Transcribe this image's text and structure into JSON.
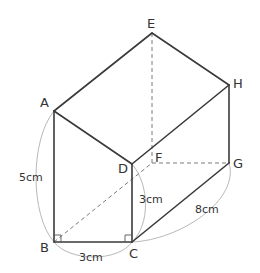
{
  "figure": {
    "type": "triangular-prism",
    "vertices": {
      "A": {
        "label": "A",
        "x": 54,
        "y": 111
      },
      "B": {
        "label": "B",
        "x": 54,
        "y": 242
      },
      "C": {
        "label": "C",
        "x": 132,
        "y": 242
      },
      "D": {
        "label": "D",
        "x": 132,
        "y": 164
      },
      "E": {
        "label": "E",
        "x": 152,
        "y": 33
      },
      "F": {
        "label": "F",
        "x": 152,
        "y": 163
      },
      "G": {
        "label": "G",
        "x": 229,
        "y": 163
      },
      "H": {
        "label": "H",
        "x": 229,
        "y": 85
      }
    },
    "dimensions": {
      "AB": "5cm",
      "BC": "3cm",
      "CD": "3cm",
      "CG": "8cm"
    },
    "right_angles": [
      "B",
      "C"
    ],
    "colors": {
      "edge": "#3a3a3a",
      "hidden_edge": "#7a7a7a",
      "dimension_arc": "#b8b8b8"
    }
  }
}
